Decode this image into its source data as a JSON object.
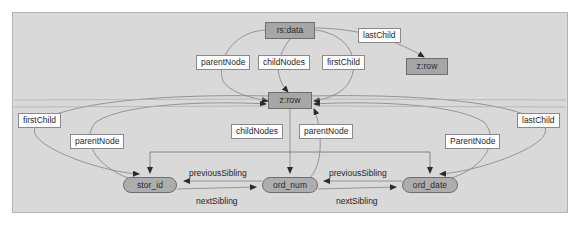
{
  "diagram": {
    "background_color": "#d9d9d9",
    "frame_border_color": "#b3b3b3",
    "node_fill_color": "#a6a6a6",
    "node_border_color": "#6e6e6e",
    "label_fill_color": "#ffffff",
    "label_border_color": "#8a8a8a",
    "edge_color": "#8c8c8c",
    "nodes": [
      {
        "id": "rs-data",
        "label": "rs:data",
        "shape": "rect",
        "x": 265,
        "y": 22,
        "w": 50,
        "h": 17
      },
      {
        "id": "z-row-right",
        "label": "z:row",
        "shape": "rect",
        "x": 406,
        "y": 58,
        "w": 42,
        "h": 17
      },
      {
        "id": "z-row-main",
        "label": "z:row",
        "shape": "rect",
        "x": 268,
        "y": 92,
        "w": 44,
        "h": 17
      },
      {
        "id": "stor-id",
        "label": "stor_id",
        "shape": "rounded",
        "x": 123,
        "y": 177,
        "w": 54,
        "h": 16
      },
      {
        "id": "ord-num",
        "label": "ord_num",
        "shape": "rounded",
        "x": 262,
        "y": 177,
        "w": 56,
        "h": 16
      },
      {
        "id": "ord-date",
        "label": "ord_date",
        "shape": "rounded",
        "x": 402,
        "y": 177,
        "w": 56,
        "h": 16
      }
    ],
    "boxed_labels": [
      {
        "id": "parentnode-top",
        "text": "parentNode",
        "x": 196,
        "y": 55
      },
      {
        "id": "childnodes-top",
        "text": "childNodes",
        "x": 258,
        "y": 55
      },
      {
        "id": "firstchild-top",
        "text": "firstChild",
        "x": 322,
        "y": 55
      },
      {
        "id": "lastchild-top",
        "text": "lastChild",
        "x": 358,
        "y": 28
      },
      {
        "id": "firstchild-left",
        "text": "firstChild",
        "x": 18,
        "y": 113
      },
      {
        "id": "parentnode-left",
        "text": "parentNode",
        "x": 70,
        "y": 134
      },
      {
        "id": "childnodes-mid",
        "text": "childNodes",
        "x": 231,
        "y": 124
      },
      {
        "id": "parentnode-mid",
        "text": "parentNode",
        "x": 299,
        "y": 124
      },
      {
        "id": "parentnode-right",
        "text": "ParentNode",
        "x": 445,
        "y": 134
      },
      {
        "id": "lastchild-right",
        "text": "lastChild",
        "x": 517,
        "y": 113
      }
    ],
    "edge_labels": [
      {
        "id": "previoussibling-1",
        "text": "previousSibling",
        "x": 189,
        "y": 169
      },
      {
        "id": "previoussibling-2",
        "text": "previousSibling",
        "x": 329,
        "y": 169
      },
      {
        "id": "nextsibling-1",
        "text": "nextSibling",
        "x": 196,
        "y": 197
      },
      {
        "id": "nextsibling-2",
        "text": "nextSibling",
        "x": 336,
        "y": 197
      }
    ]
  }
}
